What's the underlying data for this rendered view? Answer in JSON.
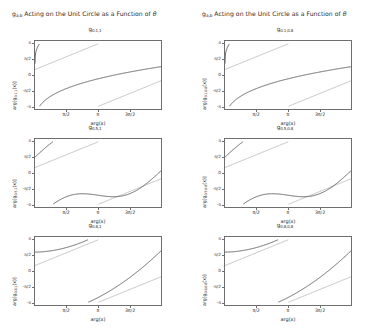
{
  "figure": {
    "width": 385,
    "height": 335,
    "background": "#ffffff",
    "columns": [
      {
        "title_prefix": "g",
        "title_sub": "a,b",
        "title_rest": " Acting on the Unit Circle as a Function of ",
        "title_symbol": "θ"
      },
      {
        "title_prefix": "g",
        "title_sub": "a,b",
        "title_rest": " Acting on the Unit Circle as a Function of ",
        "title_symbol": "θ"
      }
    ]
  },
  "axis_labels": {
    "xlabel": "arg(x)",
    "ylabel_prefix": "arg[g",
    "ylabel_suffix": "(x)]"
  },
  "ticks": {
    "x_values": [
      "π/2",
      "π",
      "3π/2"
    ],
    "y_values": [
      "π",
      "π/2",
      "0",
      "-π/2",
      "-π"
    ]
  },
  "colors": {
    "curve": "#4a4a4a",
    "reference": "#b4b4b4",
    "frame": "#6e6e6e",
    "text": "#2b2b2b"
  },
  "chart_data": [
    {
      "id": "panel-0-0",
      "type": "line",
      "title_prefix": "g",
      "title_sub": "0.1,1",
      "a": 0.1,
      "b": 1,
      "xlabel": "arg(x)",
      "ylabel_sub": "0.1,1",
      "xlim": [
        0,
        6.283185
      ],
      "ylim": [
        -3.141593,
        3.141593
      ],
      "xticks": [
        "π/2",
        "π",
        "3π/2"
      ],
      "yticks": [
        "π",
        "π/2",
        "0",
        "-π/2",
        "-π"
      ],
      "grid": false,
      "branches": 3,
      "shape": "flat-plateau",
      "series": [
        {
          "name": "arg g(x)",
          "color": "#4a4a4a",
          "style": "wrapped-sawtooth"
        },
        {
          "name": "identity reference",
          "color": "#b4b4b4",
          "style": "diagonal"
        }
      ]
    },
    {
      "id": "panel-0-1",
      "type": "line",
      "title_prefix": "g",
      "title_sub": "0.1,0.8",
      "a": 0.1,
      "b": 0.8,
      "xlabel": "arg(x)",
      "ylabel_sub": "0.1,0.8",
      "xlim": [
        0,
        6.283185
      ],
      "ylim": [
        -3.141593,
        3.141593
      ],
      "xticks": [
        "π/2",
        "π",
        "3π/2"
      ],
      "yticks": [
        "π",
        "π/2",
        "0",
        "-π/2",
        "-π"
      ],
      "grid": false,
      "branches": 3,
      "shape": "flat-plateau",
      "series": [
        {
          "name": "arg g(x)",
          "color": "#4a4a4a",
          "style": "wrapped-sawtooth"
        },
        {
          "name": "identity reference",
          "color": "#b4b4b4",
          "style": "diagonal"
        }
      ]
    },
    {
      "id": "panel-1-0",
      "type": "line",
      "title_prefix": "g",
      "title_sub": "0.5,1",
      "a": 0.5,
      "b": 1,
      "xlabel": "arg(x)",
      "ylabel_sub": "0.5,1",
      "xlim": [
        0,
        6.283185
      ],
      "ylim": [
        -3.141593,
        3.141593
      ],
      "xticks": [
        "π/2",
        "π",
        "3π/2"
      ],
      "yticks": [
        "π",
        "π/2",
        "0",
        "-π/2",
        "-π"
      ],
      "grid": false,
      "branches": 2,
      "shape": "sigmoid",
      "series": [
        {
          "name": "arg g(x)",
          "color": "#4a4a4a",
          "style": "wrapped-sigmoid"
        },
        {
          "name": "identity reference",
          "color": "#b4b4b4",
          "style": "diagonal"
        }
      ]
    },
    {
      "id": "panel-1-1",
      "type": "line",
      "title_prefix": "g",
      "title_sub": "0.5,0.8",
      "a": 0.5,
      "b": 0.8,
      "xlabel": "arg(x)",
      "ylabel_sub": "0.5,0.8",
      "xlim": [
        0,
        6.283185
      ],
      "ylim": [
        -3.141593,
        3.141593
      ],
      "xticks": [
        "π/2",
        "π",
        "3π/2"
      ],
      "yticks": [
        "π",
        "π/2",
        "0",
        "-π/2",
        "-π"
      ],
      "grid": false,
      "branches": 2,
      "shape": "sigmoid",
      "series": [
        {
          "name": "arg g(x)",
          "color": "#4a4a4a",
          "style": "wrapped-sigmoid"
        },
        {
          "name": "identity reference",
          "color": "#b4b4b4",
          "style": "diagonal"
        }
      ]
    },
    {
      "id": "panel-2-0",
      "type": "line",
      "title_prefix": "g",
      "title_sub": "0.8,1",
      "a": 0.8,
      "b": 1,
      "xlabel": "arg(x)",
      "ylabel_sub": "0.8,1",
      "xlim": [
        0,
        6.283185
      ],
      "ylim": [
        -3.141593,
        3.141593
      ],
      "xticks": [
        "π/2",
        "π",
        "3π/2"
      ],
      "yticks": [
        "π",
        "π/2",
        "0",
        "-π/2",
        "-π"
      ],
      "grid": false,
      "branches": 3,
      "shape": "steep-sawtooth",
      "series": [
        {
          "name": "arg g(x)",
          "color": "#4a4a4a",
          "style": "wrapped-steep"
        },
        {
          "name": "identity reference",
          "color": "#b4b4b4",
          "style": "diagonal"
        }
      ]
    },
    {
      "id": "panel-2-1",
      "type": "line",
      "title_prefix": "g",
      "title_sub": "0.8,0.8",
      "a": 0.8,
      "b": 0.8,
      "xlabel": "arg(x)",
      "ylabel_sub": "0.8,0.8",
      "xlim": [
        0,
        6.283185
      ],
      "ylim": [
        -3.141593,
        3.141593
      ],
      "xticks": [
        "π/2",
        "π",
        "3π/2"
      ],
      "yticks": [
        "π",
        "π/2",
        "0",
        "-π/2",
        "-π"
      ],
      "grid": false,
      "branches": 3,
      "shape": "steep-sawtooth",
      "series": [
        {
          "name": "arg g(x)",
          "color": "#4a4a4a",
          "style": "wrapped-steep"
        },
        {
          "name": "identity reference",
          "color": "#b4b4b4",
          "style": "diagonal"
        }
      ]
    }
  ]
}
